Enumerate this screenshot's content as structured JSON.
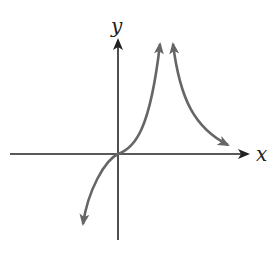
{
  "diagram": {
    "type": "function-graph",
    "axes": {
      "x_label": "x",
      "y_label": "y"
    },
    "curves": [
      {
        "name": "left-branch",
        "description": "increasing curve through origin toward vertical asymptote, arrows at both ends"
      },
      {
        "name": "right-branch",
        "description": "decreasing curve from vertical asymptote approaching x-axis, arrows at both ends"
      }
    ],
    "colors": {
      "axes": "#222222",
      "curve": "#666666"
    }
  }
}
